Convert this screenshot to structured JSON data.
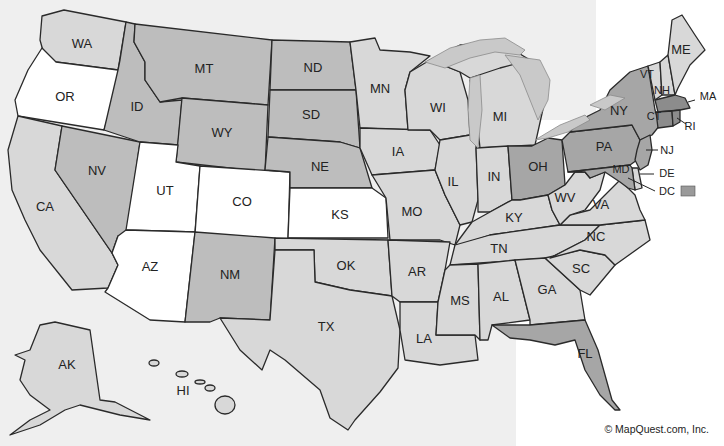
{
  "map": {
    "type": "choropleth",
    "region": "United States",
    "shades": {
      "white": "#ffffff",
      "light": "#d8d8d8",
      "medium": "#bdbdbd",
      "dark": "#a6a6a6",
      "darkest": "#8c8c8c"
    },
    "legend_swatch": {
      "label": "DC",
      "color": "#9a9a9a"
    },
    "copyright": "© MapQuest.com, Inc.",
    "states": [
      {
        "abbr": "WA",
        "shade": "light"
      },
      {
        "abbr": "OR",
        "shade": "white"
      },
      {
        "abbr": "CA",
        "shade": "light"
      },
      {
        "abbr": "NV",
        "shade": "medium"
      },
      {
        "abbr": "ID",
        "shade": "medium"
      },
      {
        "abbr": "MT",
        "shade": "medium"
      },
      {
        "abbr": "WY",
        "shade": "medium"
      },
      {
        "abbr": "UT",
        "shade": "white"
      },
      {
        "abbr": "CO",
        "shade": "white"
      },
      {
        "abbr": "AZ",
        "shade": "white"
      },
      {
        "abbr": "NM",
        "shade": "medium"
      },
      {
        "abbr": "ND",
        "shade": "medium"
      },
      {
        "abbr": "SD",
        "shade": "medium"
      },
      {
        "abbr": "NE",
        "shade": "medium"
      },
      {
        "abbr": "KS",
        "shade": "white"
      },
      {
        "abbr": "OK",
        "shade": "light"
      },
      {
        "abbr": "TX",
        "shade": "light"
      },
      {
        "abbr": "MN",
        "shade": "light"
      },
      {
        "abbr": "IA",
        "shade": "light"
      },
      {
        "abbr": "MO",
        "shade": "light"
      },
      {
        "abbr": "AR",
        "shade": "light"
      },
      {
        "abbr": "LA",
        "shade": "light"
      },
      {
        "abbr": "WI",
        "shade": "light"
      },
      {
        "abbr": "IL",
        "shade": "light"
      },
      {
        "abbr": "MI",
        "shade": "light"
      },
      {
        "abbr": "IN",
        "shade": "light"
      },
      {
        "abbr": "OH",
        "shade": "dark"
      },
      {
        "abbr": "KY",
        "shade": "light"
      },
      {
        "abbr": "TN",
        "shade": "light"
      },
      {
        "abbr": "MS",
        "shade": "light"
      },
      {
        "abbr": "AL",
        "shade": "light"
      },
      {
        "abbr": "GA",
        "shade": "light"
      },
      {
        "abbr": "FL",
        "shade": "dark"
      },
      {
        "abbr": "SC",
        "shade": "light"
      },
      {
        "abbr": "NC",
        "shade": "light"
      },
      {
        "abbr": "VA",
        "shade": "light"
      },
      {
        "abbr": "WV",
        "shade": "light"
      },
      {
        "abbr": "PA",
        "shade": "dark"
      },
      {
        "abbr": "NY",
        "shade": "dark"
      },
      {
        "abbr": "VT",
        "shade": "light"
      },
      {
        "abbr": "NH",
        "shade": "light"
      },
      {
        "abbr": "ME",
        "shade": "light"
      },
      {
        "abbr": "MA",
        "shade": "darkest"
      },
      {
        "abbr": "RI",
        "shade": "darkest"
      },
      {
        "abbr": "CT",
        "shade": "darkest"
      },
      {
        "abbr": "NJ",
        "shade": "dark"
      },
      {
        "abbr": "DE",
        "shade": "light"
      },
      {
        "abbr": "MD",
        "shade": "dark"
      },
      {
        "abbr": "DC",
        "shade": "dark"
      },
      {
        "abbr": "AK",
        "shade": "light"
      },
      {
        "abbr": "HI",
        "shade": "light"
      }
    ]
  }
}
